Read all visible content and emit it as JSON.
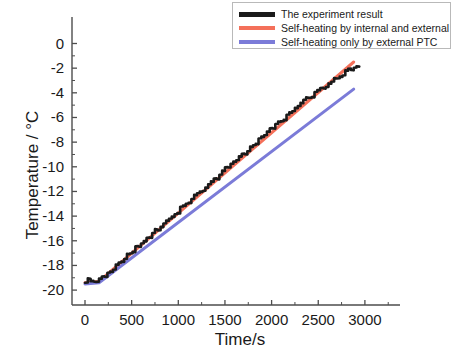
{
  "chart_data": {
    "type": "line",
    "title": "",
    "xlabel": "Time/s",
    "ylabel": "Temperature / °C",
    "xlim": [
      -140,
      3380
    ],
    "ylim": [
      -21.3,
      0.8
    ],
    "xticks": [
      0,
      500,
      1000,
      1500,
      2000,
      2500,
      3000
    ],
    "yticks": [
      0,
      -2,
      -4,
      -6,
      -8,
      -10,
      -12,
      -14,
      -16,
      -18,
      -20
    ],
    "xtick_labels": [
      "0",
      "500",
      "1000",
      "1500",
      "2000",
      "2500",
      "3000"
    ],
    "ytick_labels": [
      "0",
      "-2",
      "-4",
      "-6",
      "-8",
      "-10",
      "-12",
      "-14",
      "-16",
      "-18",
      "-20"
    ],
    "grid": false,
    "legend_position": "top-right",
    "series": [
      {
        "name": "The experiment result",
        "color": "#1a1a1a",
        "width": 2.6,
        "style": "noisy",
        "x": [
          0,
          60,
          120,
          180,
          240,
          300,
          360,
          420,
          480,
          540,
          600,
          660,
          720,
          780,
          840,
          900,
          960,
          1020,
          1080,
          1140,
          1200,
          1260,
          1320,
          1380,
          1440,
          1500,
          1560,
          1620,
          1680,
          1740,
          1800,
          1860,
          1920,
          1980,
          2040,
          2100,
          2160,
          2220,
          2280,
          2340,
          2400,
          2460,
          2520,
          2580,
          2640,
          2700,
          2760,
          2820,
          2880
        ],
        "y": [
          -19.4,
          -19.4,
          -19.3,
          -19.0,
          -18.6,
          -18.2,
          -17.8,
          -17.4,
          -17.0,
          -16.6,
          -16.2,
          -15.8,
          -15.4,
          -15.0,
          -14.6,
          -14.2,
          -13.8,
          -13.4,
          -13.0,
          -12.6,
          -12.2,
          -11.8,
          -11.4,
          -11.0,
          -10.6,
          -10.2,
          -9.8,
          -9.4,
          -9.0,
          -8.6,
          -8.2,
          -7.8,
          -7.4,
          -7.0,
          -6.6,
          -6.2,
          -5.8,
          -5.4,
          -5.0,
          -4.7,
          -4.4,
          -4.0,
          -3.7,
          -3.4,
          -3.1,
          -2.8,
          -2.5,
          -2.2,
          -2.0
        ]
      },
      {
        "name": "Self-heating by internal and external",
        "color": "#f4705a",
        "width": 3.0,
        "style": "solid",
        "x": [
          0,
          150,
          2880
        ],
        "y": [
          -19.4,
          -19.3,
          -1.5
        ]
      },
      {
        "name": "Self-heating only by external PTC",
        "color": "#7b7bd8",
        "width": 3.0,
        "style": "solid",
        "x": [
          0,
          150,
          2880
        ],
        "y": [
          -19.5,
          -19.4,
          -3.7
        ]
      }
    ]
  },
  "axes": {
    "y_title": "Temperature / °C",
    "x_title": "Time/s"
  },
  "legend": {
    "items": [
      {
        "label": "The experiment result",
        "color": "#1a1a1a"
      },
      {
        "label": "Self-heating by internal and external",
        "color": "#f4705a"
      },
      {
        "label": "Self-heating only by external PTC",
        "color": "#7b7bd8"
      }
    ]
  }
}
